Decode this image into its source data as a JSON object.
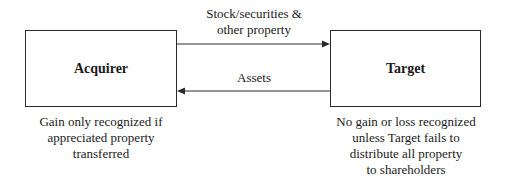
{
  "diagram": {
    "nodes": [
      {
        "id": "acquirer",
        "label": "Acquirer",
        "caption": [
          "Gain only recognized if",
          "appreciated property",
          "transferred"
        ]
      },
      {
        "id": "target",
        "label": "Target",
        "caption": [
          "No gain or loss recognized",
          "unless Target fails to",
          "distribute all property",
          "to shareholders"
        ]
      }
    ],
    "edges": [
      {
        "from": "acquirer",
        "to": "target",
        "label": [
          "Stock/securities &",
          "other property"
        ]
      },
      {
        "from": "target",
        "to": "acquirer",
        "label": [
          "Assets"
        ]
      }
    ]
  }
}
